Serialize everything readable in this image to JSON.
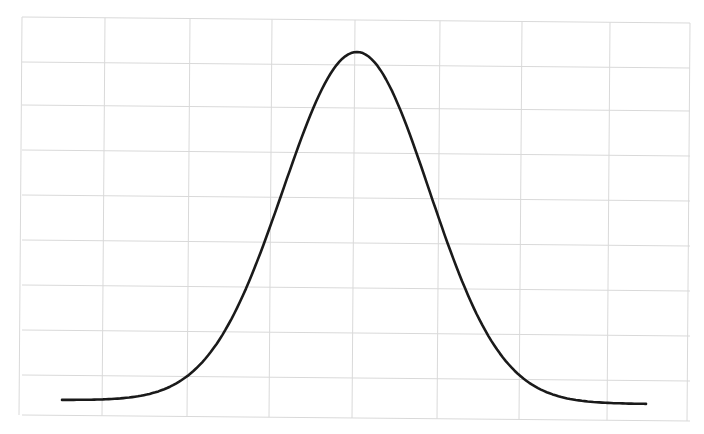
{
  "chart_data": {
    "type": "line",
    "title": "",
    "xlabel": "",
    "ylabel": "",
    "grid": true,
    "legend": null,
    "x": [
      -4,
      -3.5,
      -3,
      -2.5,
      -2,
      -1.5,
      -1,
      -0.5,
      0,
      0.5,
      1,
      1.5,
      2,
      2.5,
      3,
      3.5,
      4
    ],
    "series": [
      {
        "name": "density",
        "values": [
          0.0001,
          0.0009,
          0.0044,
          0.0175,
          0.054,
          0.1295,
          0.242,
          0.3521,
          0.3989,
          0.3521,
          0.242,
          0.1295,
          0.054,
          0.0175,
          0.0044,
          0.0009,
          0.0001
        ]
      }
    ],
    "xlim": [
      -4,
      4
    ],
    "ylim": [
      0,
      0.42
    ]
  },
  "style": {
    "background": "#ffffff",
    "grid_color": "#d9d9d9",
    "curve_color": "#1a1a1a"
  },
  "layout": {
    "plot_left": 22,
    "plot_right": 690,
    "plot_top": 17,
    "plot_bottom": 415,
    "vertical_gridlines": [
      22,
      105,
      190,
      272,
      355,
      440,
      522,
      610,
      690
    ],
    "horizontal_gridlines": [
      17,
      62,
      105,
      150,
      195,
      240,
      285,
      330,
      375,
      415
    ],
    "curve_x_start": 62,
    "curve_x_end": 646,
    "curve_baseline_y": 400,
    "curve_peak_y": 50,
    "curve_peak_x": 357
  }
}
